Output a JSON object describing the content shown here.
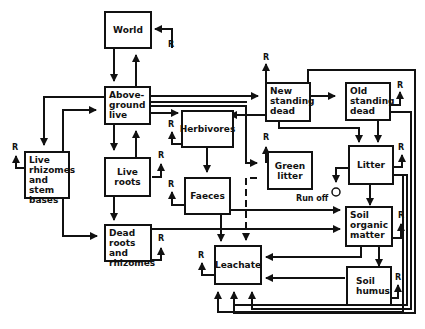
{
  "diagram": {
    "type": "flow-diagram",
    "nodes": {
      "world": "World",
      "aboveground_live": "Above-\nground\nlive",
      "new_standing_dead": "New\nstanding\ndead",
      "old_standing_dead": "Old\nstanding\ndead",
      "herbivores": "Herbivores",
      "green_litter": "Green\nlitter",
      "litter": "Litter",
      "live_rhizomes": "Live\nrhizomes\nand stem\nbases",
      "live_roots": "Live roots",
      "faeces": "Faeces",
      "soil_organic_matter": "Soil\norganic\nmatter",
      "dead_roots": "Dead\nroots and\nrhizomes",
      "leachate": "Leachate",
      "soil_humus": "Soil\nhumus"
    },
    "labels": {
      "respiration": "R",
      "run_off": "Run off"
    },
    "edges": [
      [
        "World",
        "Above-ground live"
      ],
      [
        "Above-ground live",
        "World"
      ],
      [
        "Above-ground live",
        "New standing dead"
      ],
      [
        "Above-ground live",
        "Herbivores"
      ],
      [
        "Above-ground live",
        "Green litter"
      ],
      [
        "Above-ground live",
        "Live rhizomes and stem bases"
      ],
      [
        "Above-ground live",
        "Live roots"
      ],
      [
        "Live roots",
        "Above-ground live"
      ],
      [
        "Live rhizomes and stem bases",
        "Above-ground live"
      ],
      [
        "New standing dead",
        "Old standing dead"
      ],
      [
        "New standing dead",
        "Herbivores"
      ],
      [
        "New standing dead",
        "Litter"
      ],
      [
        "New standing dead",
        "Leachate"
      ],
      [
        "Old standing dead",
        "Litter"
      ],
      [
        "Old standing dead",
        "Leachate"
      ],
      [
        "Herbivores",
        "Faeces"
      ],
      [
        "Faeces",
        "Soil organic matter"
      ],
      [
        "Faeces",
        "Leachate"
      ],
      [
        "Green litter",
        "Leachate"
      ],
      [
        "Litter",
        "Soil organic matter"
      ],
      [
        "Litter",
        "Run off"
      ],
      [
        "Litter",
        "Leachate"
      ],
      [
        "Live roots",
        "Dead roots and rhizomes"
      ],
      [
        "Live rhizomes and stem bases",
        "Dead roots and rhizomes"
      ],
      [
        "Dead roots and rhizomes",
        "Soil organic matter"
      ],
      [
        "Soil organic matter",
        "Leachate"
      ],
      [
        "Soil organic matter",
        "Soil humus"
      ],
      [
        "Soil humus",
        "Leachate"
      ]
    ]
  }
}
